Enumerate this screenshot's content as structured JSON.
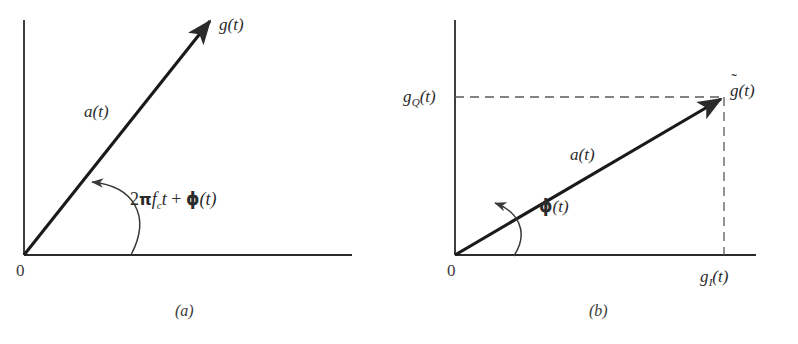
{
  "figure": {
    "type": "phasor-diagram-pair",
    "background_color": "#ffffff",
    "ink_color": "#2b2b2b",
    "panels": [
      {
        "id": "a",
        "caption": "(a)",
        "origin_label": "0",
        "vector_label": "a(t)",
        "tip_label": "g(t)",
        "angle_label_parts": {
          "two": "2",
          "pi": "π",
          "f": "f",
          "f_subscript": "c",
          "t": "t",
          "plus": "+",
          "phi": "ϕ",
          "phi_arg": "(t)"
        },
        "angle_label_plain": "2πfᴄt + ϕ(t)",
        "description": "Phasor g(t) of length a(t) at angle 2πf_c t + ϕ(t) from the horizontal axis"
      },
      {
        "id": "b",
        "caption": "(b)",
        "origin_label": "0",
        "vector_label": "a(t)",
        "tip_label_base": "g",
        "tip_label_accent": "˜",
        "tip_label_arg": "(t)",
        "tip_label_plain": "g̃(t)",
        "y_axis_label_base": "g",
        "y_axis_label_sub": "Q",
        "y_axis_label_arg": "(t)",
        "y_axis_label_plain": "g_Q(t)",
        "x_axis_label_base": "g",
        "x_axis_label_sub": "I",
        "x_axis_label_arg": "(t)",
        "x_axis_label_plain": "g_I(t)",
        "angle_label_phi": "ϕ",
        "angle_label_arg": "(t)",
        "angle_label_plain": "ϕ(t)",
        "description": "Complex envelope g̃(t) resolved into in-phase component g_I(t) and quadrature component g_Q(t), at angle ϕ(t)"
      }
    ]
  },
  "geometry": {
    "panel_a": {
      "origin": [
        24,
        255
      ],
      "y_axis_top": [
        24,
        20
      ],
      "x_axis_right": [
        352,
        255
      ],
      "vector_tip": [
        213,
        18
      ],
      "arc_start": [
        128,
        255
      ],
      "arc_end": [
        88,
        185
      ]
    },
    "panel_b": {
      "origin": [
        56,
        255
      ],
      "y_axis_top": [
        56,
        20
      ],
      "x_axis_right": [
        355,
        255
      ],
      "vector_tip": [
        325,
        97
      ],
      "dash_horizontal_y": 97,
      "dash_vertical_x": 325,
      "arc_start": [
        113,
        255
      ],
      "arc_end": [
        92,
        205
      ]
    }
  }
}
